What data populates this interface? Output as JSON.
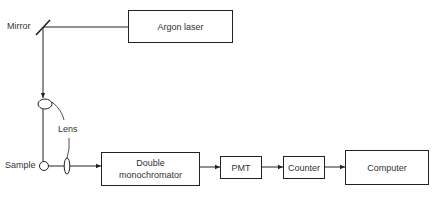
{
  "diagram": {
    "labels": {
      "mirror": "Mirror",
      "lens": "Lens",
      "sample": "Sample"
    },
    "boxes": {
      "argon_laser": "Argon laser",
      "monochromator_line1": "Double",
      "monochromator_line2": "monochromator",
      "pmt": "PMT",
      "counter": "Counter",
      "computer": "Computer"
    },
    "colors": {
      "line": "#222222",
      "background": "#ffffff"
    }
  }
}
